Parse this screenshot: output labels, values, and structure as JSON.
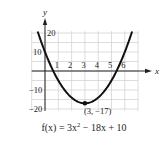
{
  "chart_data": {
    "type": "line",
    "title": "",
    "function": "f(x) = 3x^2 - 18x + 10",
    "xlabel": "x",
    "ylabel": "y",
    "xlim": [
      -1,
      7
    ],
    "ylim": [
      -21,
      22
    ],
    "x_ticks": [
      1,
      2,
      3,
      4,
      5,
      6
    ],
    "x_tick_labels": [
      "1",
      "2",
      "3",
      "4",
      "5",
      "6"
    ],
    "y_ticks": [
      20,
      10,
      -10,
      -20
    ],
    "y_tick_labels": [
      "20",
      "10",
      "−10",
      "−20"
    ],
    "grid": true,
    "legend": null,
    "series": [
      {
        "name": "f(x) = 3x^2 - 18x + 10",
        "x": [
          -0.5,
          0,
          0.5,
          1,
          1.5,
          2,
          2.5,
          3,
          3.5,
          4,
          4.5,
          5,
          5.5,
          6,
          6.5
        ],
        "y": [
          19.75,
          10,
          1.75,
          -5,
          -10.25,
          -14,
          -16.25,
          -17,
          -16.25,
          -14,
          -10.25,
          -5,
          1.75,
          10,
          19.75
        ]
      }
    ],
    "annotations": [
      {
        "type": "point",
        "x": 3,
        "y": -17,
        "label": "(3, −17)"
      }
    ]
  },
  "formula": {
    "lhs": "f(x) = 3x",
    "exp": "2",
    "rhs": " − 18x + 10"
  }
}
